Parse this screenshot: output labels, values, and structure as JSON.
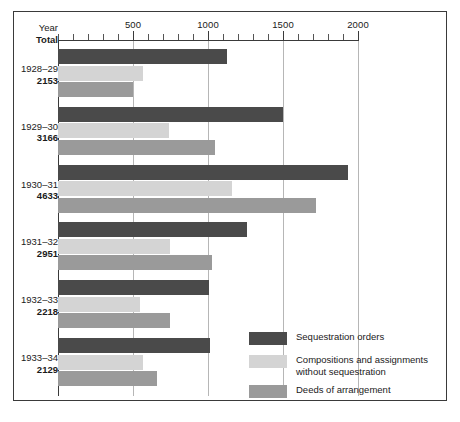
{
  "chart_data": {
    "type": "bar",
    "orientation": "horizontal",
    "title": "",
    "xlabel": "",
    "ylabel": "",
    "xlim": [
      0,
      2100
    ],
    "grid": true,
    "legend_position": "bottom-right",
    "axis": {
      "tick_labels": [
        "500",
        "1000",
        "1500",
        "2000"
      ],
      "tick_values": [
        500,
        1000,
        1500,
        2000
      ],
      "minor_tick_step": 100
    },
    "row_header": {
      "line1": "Year",
      "line2": "Total"
    },
    "categories": [
      "1928–29",
      "1929–30",
      "1930–31",
      "1931–32",
      "1932–33",
      "1933–34"
    ],
    "totals": [
      2153,
      3166,
      4633,
      2951,
      2218,
      2129
    ],
    "series": [
      {
        "name": "Sequestration orders",
        "color": "#4a4a4a",
        "values": [
          1125,
          1500,
          1935,
          1260,
          1005,
          1015
        ]
      },
      {
        "name": "Compositions and assignments\nwithout sequestration",
        "color": "#d4d4d4",
        "values": [
          565,
          740,
          1160,
          745,
          545,
          565
        ]
      },
      {
        "name": "Deeds of arrangement",
        "color": "#9a9a9a",
        "values": [
          498,
          1045,
          1720,
          1025,
          745,
          660
        ]
      }
    ]
  }
}
